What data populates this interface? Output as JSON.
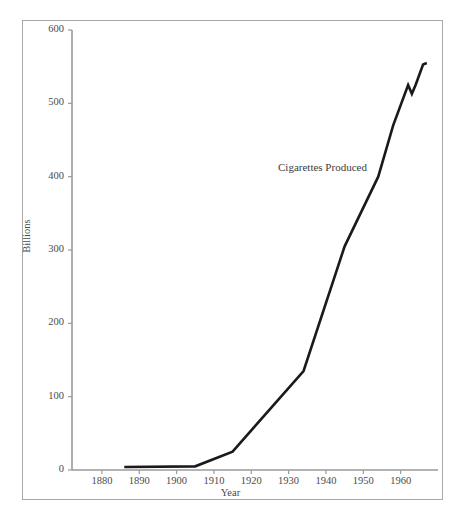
{
  "figure": {
    "annotation": "Cigarettes Produced",
    "caption": "",
    "background_color": "#ffffff",
    "frame_color": "#a8a8a8",
    "line_color": "#1a1a1a"
  },
  "chart_data": {
    "type": "line",
    "title": "",
    "subtitle": "",
    "xlabel": "Year",
    "ylabel": "Billions",
    "xlim": [
      1872,
      1970
    ],
    "ylim": [
      0,
      600
    ],
    "grid": false,
    "legend_position": "none",
    "annotations": [
      {
        "text": "Cigarettes Produced",
        "x": 1934,
        "y": 420
      }
    ],
    "xticks": [
      1880,
      1890,
      1900,
      1910,
      1920,
      1930,
      1940,
      1950,
      1960
    ],
    "xtick_labels": [
      "1880",
      "1890",
      "1900",
      "1910",
      "1920",
      "1930",
      "1940",
      "1950",
      "1960"
    ],
    "yticks": [
      0,
      100,
      200,
      300,
      400,
      500,
      600
    ],
    "ytick_labels": [
      "0",
      "100",
      "200",
      "300",
      "400",
      "500",
      "600"
    ],
    "series": [
      {
        "name": "Cigarettes Produced",
        "color": "#1a1a1a",
        "x": [
          1886,
          1905,
          1915,
          1934,
          1945,
          1954,
          1958,
          1962,
          1963,
          1964,
          1966,
          1967
        ],
        "values": [
          4,
          5,
          25,
          135,
          305,
          400,
          470,
          525,
          513,
          525,
          553,
          555
        ]
      }
    ]
  }
}
